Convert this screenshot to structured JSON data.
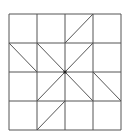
{
  "diagram": {
    "grid": {
      "rows": 4,
      "cols": 4,
      "origin": [
        9,
        14
      ],
      "cell_w": 28,
      "cell_h": 29
    },
    "line_color": "#555555",
    "center_point_color": "#222222",
    "diagonals": [
      {
        "x1": 93,
        "y1": 14,
        "x2": 65,
        "y2": 43
      },
      {
        "x1": 9,
        "y1": 43,
        "x2": 37,
        "y2": 72
      },
      {
        "x1": 37,
        "y1": 43,
        "x2": 65,
        "y2": 72
      },
      {
        "x1": 93,
        "y1": 43,
        "x2": 65,
        "y2": 72
      },
      {
        "x1": 65,
        "y1": 72,
        "x2": 37,
        "y2": 101
      },
      {
        "x1": 65,
        "y1": 72,
        "x2": 93,
        "y2": 101
      },
      {
        "x1": 93,
        "y1": 72,
        "x2": 121,
        "y2": 101
      },
      {
        "x1": 65,
        "y1": 101,
        "x2": 37,
        "y2": 130
      }
    ]
  }
}
